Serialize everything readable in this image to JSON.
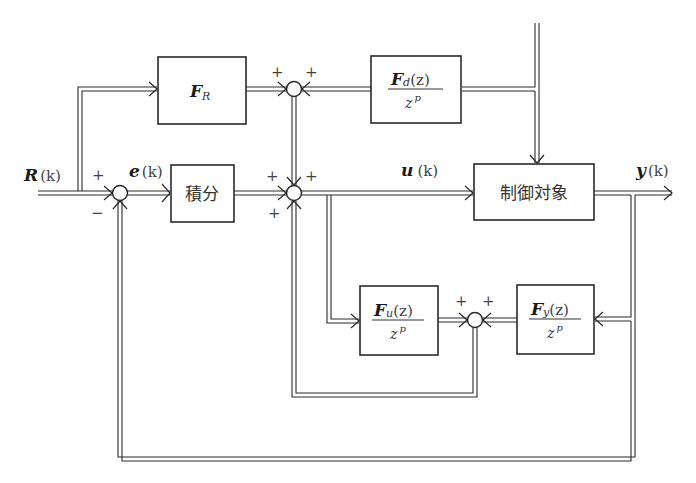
{
  "diagram": {
    "type": "control-block-diagram",
    "signals": {
      "reference": {
        "symbol": "R",
        "arg": "(k)"
      },
      "error": {
        "symbol": "e",
        "arg": "(k)"
      },
      "control_input": {
        "symbol": "u",
        "arg": "(k)"
      },
      "output": {
        "symbol": "y",
        "arg": "(k)"
      }
    },
    "blocks": {
      "feedforward_ref": {
        "symbol": "F",
        "subscript": "R"
      },
      "integrator": {
        "label": "積分"
      },
      "disturbance_ff": {
        "numerator_symbol": "F",
        "numerator_subscript": "d",
        "numerator_arg": "(z)",
        "denominator": "z",
        "denominator_exp": "p"
      },
      "plant": {
        "label": "制御対象"
      },
      "input_filter": {
        "numerator_symbol": "F",
        "numerator_subscript": "u",
        "numerator_arg": "(z)",
        "denominator": "z",
        "denominator_exp": "p"
      },
      "output_filter": {
        "numerator_symbol": "F",
        "numerator_subscript": "y",
        "numerator_arg": "(z)",
        "denominator": "z",
        "denominator_exp": "p"
      }
    },
    "summing_junctions": {
      "error_sum": {
        "signs": [
          "+",
          "−"
        ]
      },
      "top_sum": {
        "signs": [
          "+",
          "+"
        ]
      },
      "main_sum": {
        "signs": [
          "+",
          "+",
          "+"
        ]
      },
      "filter_sum": {
        "signs": [
          "+",
          "+"
        ]
      }
    }
  }
}
